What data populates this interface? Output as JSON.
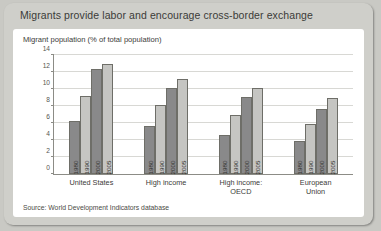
{
  "card": {
    "title": "Migrants provide labor and encourage cross-border exchange",
    "subtitle": "Migrant population (% of total population)",
    "source": "Source: World Development Indicators database"
  },
  "colors": {
    "card_background": "#cfcfca",
    "panel_background": "#ffffff",
    "bar_dark": "#89898a",
    "bar_light": "#c5c5c2",
    "axis": "#8c8c86",
    "gridline": "#d8d8d4"
  },
  "chart_data": {
    "type": "bar",
    "title": "Migrants provide labor and encourage cross-border exchange",
    "subtitle": "Migrant population (% of total population)",
    "xlabel": "",
    "ylabel": "",
    "ylim": [
      0,
      14
    ],
    "yticks": [
      0,
      2,
      4,
      6,
      8,
      10,
      12,
      14
    ],
    "ytick_labels": [
      "0",
      "2",
      "4",
      "6",
      "8",
      "10",
      "12",
      "14"
    ],
    "grid": true,
    "legend": "none",
    "categories": [
      "United States",
      "High income",
      "High income: OECD",
      "European Union"
    ],
    "category_lines": [
      [
        "United States"
      ],
      [
        "High income"
      ],
      [
        "High income:",
        "OECD"
      ],
      [
        "European",
        "Union"
      ]
    ],
    "bar_labels": [
      "1980",
      "1990",
      "2000",
      "2005"
    ],
    "series": [
      {
        "name": "1980",
        "values": [
          6.2,
          5.7,
          4.6,
          3.9
        ]
      },
      {
        "name": "1990",
        "values": [
          9.2,
          8.1,
          6.9,
          5.9
        ]
      },
      {
        "name": "2000",
        "values": [
          12.3,
          10.1,
          9.1,
          7.7
        ]
      },
      {
        "name": "2005",
        "values": [
          13.0,
          11.2,
          10.1,
          8.9
        ]
      }
    ],
    "groups": [
      {
        "category": "United States",
        "bars": [
          {
            "year": "1980",
            "value": 6.2
          },
          {
            "year": "1990",
            "value": 9.2
          },
          {
            "year": "2000",
            "value": 12.3
          },
          {
            "year": "2005",
            "value": 13.0
          }
        ]
      },
      {
        "category": "High income",
        "bars": [
          {
            "year": "1980",
            "value": 5.7
          },
          {
            "year": "1990",
            "value": 8.1
          },
          {
            "year": "2000",
            "value": 10.1
          },
          {
            "year": "2005",
            "value": 11.2
          }
        ]
      },
      {
        "category": "High income: OECD",
        "bars": [
          {
            "year": "1980",
            "value": 4.6
          },
          {
            "year": "1990",
            "value": 6.9
          },
          {
            "year": "2000",
            "value": 9.1
          },
          {
            "year": "2005",
            "value": 10.1
          }
        ]
      },
      {
        "category": "European Union",
        "bars": [
          {
            "year": "1980",
            "value": 3.9
          },
          {
            "year": "1990",
            "value": 5.9
          },
          {
            "year": "2000",
            "value": 7.7
          },
          {
            "year": "2005",
            "value": 8.9
          }
        ]
      }
    ]
  }
}
